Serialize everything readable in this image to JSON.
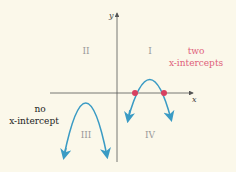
{
  "diagram": {
    "axes": {
      "x_label": "x",
      "y_label": "y"
    },
    "quadrants": {
      "q1": "I",
      "q2": "II",
      "q3": "III",
      "q4": "IV"
    },
    "annotations": {
      "two_line1": "two",
      "two_line2": "x-intercepts",
      "no_line1": "no",
      "no_line2": "x-intercept"
    },
    "colors": {
      "background": "#fbf8ea",
      "curve": "#3a9bc4",
      "intercept_point": "#d84060",
      "intercept_text": "#e0607a",
      "axis": "#555555",
      "quadrant_text": "#9a9a9a"
    }
  }
}
